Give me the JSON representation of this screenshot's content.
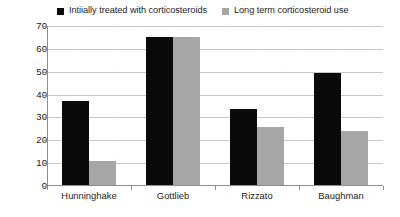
{
  "chart_data": {
    "type": "bar",
    "title": "",
    "subtitle": "",
    "xlabel": "",
    "ylabel": "Percentage",
    "ylim": [
      0,
      70
    ],
    "yticks": [
      0,
      10,
      20,
      30,
      40,
      50,
      60,
      70
    ],
    "ytick_labels": [
      "0",
      "10",
      "20",
      "30",
      "40",
      "50",
      "60",
      "70"
    ],
    "grid": "horizontal",
    "legend_position": "top",
    "categories": [
      "Hunninghake",
      "Gottlieb",
      "Rizzato",
      "Baughman"
    ],
    "series": [
      {
        "name": "Intiially treated with corticosteroids",
        "color": "#0a0a0a",
        "values": [
          37,
          65,
          33.5,
          49.5
        ]
      },
      {
        "name": "Long term corticosteroid use",
        "color": "#a6a6a6",
        "values": [
          11,
          65,
          26,
          24
        ]
      }
    ]
  },
  "legend": {
    "entries": [
      {
        "label": "Intiially treated with corticosteroids",
        "swatch": "#0a0a0a"
      },
      {
        "label": "Long term corticosteroid use",
        "swatch": "#a6a6a6"
      }
    ]
  },
  "axes": {
    "y_title": "Percentage"
  }
}
